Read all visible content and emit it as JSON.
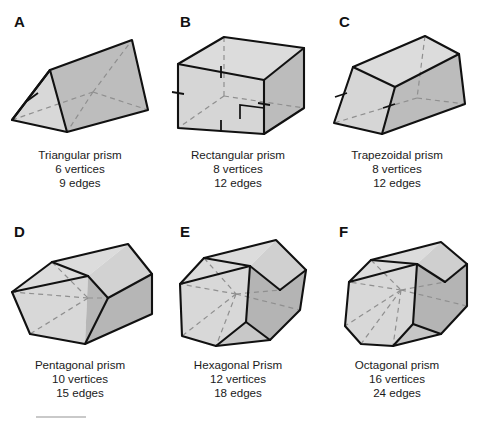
{
  "figure": {
    "colors": {
      "face_light": "#d6d6d6",
      "face_mid": "#c6c6c6",
      "face_dark": "#b0b0b0",
      "face_top": "#dedede",
      "outline": "#111111",
      "hidden_edge": "#8a8a8a",
      "background": "#ffffff",
      "footer_rule": "#c9c9c9"
    },
    "panels": [
      {
        "letter": "A",
        "shape": "triangular-prism",
        "name": "Triangular prism",
        "vertices": "6 vertices",
        "edges": "9 edges",
        "tick_marks": 1,
        "right_angle_mark": false
      },
      {
        "letter": "B",
        "shape": "rectangular-prism",
        "name": "Rectangular prism",
        "vertices": "8 vertices",
        "edges": "12 edges",
        "tick_marks": 4,
        "right_angle_mark": true
      },
      {
        "letter": "C",
        "shape": "trapezoidal-prism",
        "name": "Trapezoidal prism",
        "vertices": "8 vertices",
        "edges": "12 edges",
        "tick_marks": 2,
        "right_angle_mark": false
      },
      {
        "letter": "D",
        "shape": "pentagonal-prism",
        "name": "Pentagonal prism",
        "vertices": "10 vertices",
        "edges": "15 edges",
        "tick_marks": 0,
        "right_angle_mark": false
      },
      {
        "letter": "E",
        "shape": "hexagonal-prism",
        "name": "Hexagonal Prism",
        "vertices": "12 vertices",
        "edges": "18 edges",
        "tick_marks": 0,
        "right_angle_mark": false
      },
      {
        "letter": "F",
        "shape": "octagonal-prism",
        "name": "Octagonal prism",
        "vertices": "16 vertices",
        "edges": "24 edges",
        "tick_marks": 0,
        "right_angle_mark": false
      }
    ]
  }
}
